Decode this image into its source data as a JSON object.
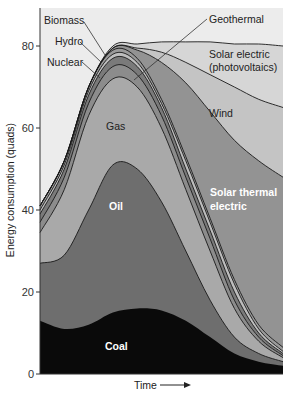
{
  "chart_data": {
    "type": "area",
    "stacked": true,
    "title": "",
    "xlabel": "Time",
    "ylabel": "Energy consumption (quads)",
    "ylim": [
      0,
      88
    ],
    "yticks": [
      0,
      20,
      40,
      60,
      80
    ],
    "x": [
      0,
      10,
      20,
      30,
      40,
      50,
      60,
      70,
      80,
      90,
      100
    ],
    "x_note": "Time axis unlabeled (relative units, arrow indicates time progression)",
    "cumulative_tops": true,
    "series": [
      {
        "name": "Coal",
        "color": "#0a0a0a",
        "values": [
          13,
          11,
          12,
          15,
          16,
          15.5,
          13,
          9,
          5,
          3,
          2
        ]
      },
      {
        "name": "Oil",
        "color": "#6e6e6e",
        "values": [
          27,
          29,
          40,
          51,
          50,
          42,
          30,
          18,
          9,
          5,
          3
        ]
      },
      {
        "name": "Gas",
        "color": "#a9a9a9",
        "values": [
          34.5,
          45,
          63,
          72,
          70,
          60,
          45,
          30,
          16,
          8,
          4
        ]
      },
      {
        "name": "Nuclear",
        "color": "#8c8c8c",
        "values": [
          37,
          48,
          66,
          75,
          73,
          63,
          48,
          33,
          18,
          9,
          4.5
        ]
      },
      {
        "name": "Hydro",
        "color": "#7a7a7a",
        "values": [
          39,
          50,
          68,
          77,
          75,
          65,
          50,
          35,
          20,
          10,
          5
        ]
      },
      {
        "name": "Biomass",
        "color": "#bdbdbd",
        "values": [
          40,
          51,
          69,
          78,
          76,
          66,
          52,
          37,
          22,
          11,
          5.5
        ]
      },
      {
        "name": "Geothermal",
        "color": "#9a9a9a",
        "values": [
          41,
          52,
          70,
          79,
          77,
          67,
          53,
          38,
          23,
          12,
          6.5
        ]
      },
      {
        "name": "Solar thermal electric",
        "color": "#939393",
        "values": [
          41,
          52,
          70,
          79.5,
          79,
          76,
          71,
          64,
          57,
          52,
          48
        ]
      },
      {
        "name": "Wind",
        "color": "#c4c4c4",
        "values": [
          41,
          52,
          70,
          79.5,
          79.5,
          78.5,
          76,
          73,
          70,
          67,
          65
        ]
      },
      {
        "name": "Solar electric (photovoltaics)",
        "color": "#d6d6d6",
        "values": [
          41,
          52,
          70,
          80,
          80.5,
          81,
          81,
          81,
          80.5,
          80.5,
          80
        ]
      }
    ],
    "annotations": [
      {
        "text": "Biomass",
        "pointer": true
      },
      {
        "text": "Hydro",
        "pointer": true
      },
      {
        "text": "Nuclear",
        "pointer": true
      },
      {
        "text": "Geothermal",
        "pointer": true
      },
      {
        "text": "Solar electric (photovoltaics)"
      },
      {
        "text": "Wind"
      },
      {
        "text": "Gas"
      },
      {
        "text": "Oil"
      },
      {
        "text": "Solar thermal electric"
      },
      {
        "text": "Coal"
      }
    ],
    "grid": false,
    "legend": "inline labels"
  },
  "labels": {
    "biomass": "Biomass",
    "hydro": "Hydro",
    "nuclear": "Nuclear",
    "geothermal": "Geothermal",
    "solar_pv_1": "Solar electric",
    "solar_pv_2": "(photovoltaics)",
    "wind": "Wind",
    "gas": "Gas",
    "oil": "Oil",
    "solar_thermal_1": "Solar thermal",
    "solar_thermal_2": "electric",
    "coal": "Coal"
  },
  "axes": {
    "ylabel": "Energy consumption (quads)",
    "xlabel": "Time",
    "yticks": [
      "0",
      "20",
      "40",
      "60",
      "80"
    ]
  }
}
